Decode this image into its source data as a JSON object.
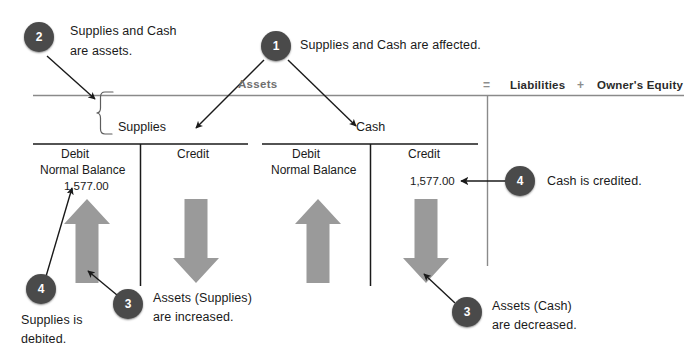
{
  "diagram": {
    "accounting_equation": {
      "assets_label": "Assets",
      "equals_sign": "=",
      "liabilities_label": "Liabilities",
      "plus_sign": "+",
      "owners_equity_label": "Owner's Equity"
    },
    "accounts": [
      {
        "name": "Supplies",
        "debit_header": "Debit",
        "debit_subheader": "Normal Balance",
        "debit_amount": "1,577.00",
        "credit_header": "Credit",
        "credit_amount": "",
        "debit_arrow": "up",
        "credit_arrow": "down"
      },
      {
        "name": "Cash",
        "debit_header": "Debit",
        "debit_subheader": "Normal Balance",
        "debit_amount": "",
        "credit_header": "Credit",
        "credit_amount": "1,577.00",
        "debit_arrow": "up",
        "credit_arrow": "down"
      }
    ],
    "callouts": [
      {
        "number": "1",
        "text_line1": "Supplies and Cash are affected.",
        "text_line2": ""
      },
      {
        "number": "2",
        "text_line1": "Supplies and Cash",
        "text_line2": "are assets."
      },
      {
        "number": "3",
        "text_line1": "Assets (Supplies)",
        "text_line2": "are increased."
      },
      {
        "number": "4",
        "text_line1": "Supplies is",
        "text_line2": "debited."
      },
      {
        "number": "4",
        "text_line1": "Cash is credited.",
        "text_line2": ""
      },
      {
        "number": "3",
        "text_line1": "Assets (Cash)",
        "text_line2": "are decreased."
      }
    ],
    "colors": {
      "badge_fill": "#4a4a4a",
      "badge_text": "#ffffff",
      "block_arrow_fill": "#9a9a9a",
      "rule_line": "#8a8a8a",
      "account_line": "#1a1a1a",
      "text": "#1a1a1a",
      "muted_text": "#6f6f6f",
      "background": "#ffffff"
    }
  }
}
